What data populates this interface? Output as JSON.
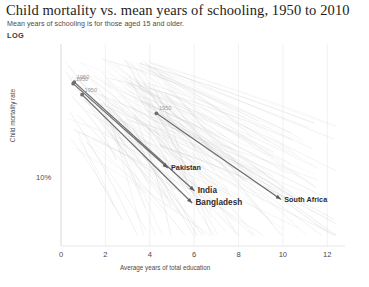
{
  "header": {
    "title": "Child mortality vs. mean years of schooling, 1950 to 2010",
    "subtitle": "Mean years of schooling is for those aged 15 and older.",
    "scale_badge": "LOG"
  },
  "chart_data": {
    "type": "line",
    "title": "Child mortality vs. mean years of schooling, 1950 to 2010",
    "subtitle": "Mean years of schooling is for those aged 15 and older.",
    "xlabel": "Average years of total education",
    "ylabel": "Child mortality rate",
    "yscale": "log",
    "xlim": [
      0,
      12.8
    ],
    "xticks": [
      0,
      2,
      4,
      6,
      8,
      10,
      12
    ],
    "xtick_labels": [
      "0",
      "2",
      "4",
      "6",
      "8",
      "10",
      "12"
    ],
    "yticks": [
      10
    ],
    "ytick_labels": [
      "10%"
    ],
    "grid": "vertical-faint",
    "legend": "none",
    "annotation_year_start": "1950",
    "series": [
      {
        "name": "Bangladesh",
        "highlight": true,
        "start_year": "1950",
        "end_year": "2010",
        "start": {
          "x": 0.95,
          "y": 30.5
        },
        "end": {
          "x": 5.9,
          "y": 4.6
        },
        "label_position": "right"
      },
      {
        "name": "India",
        "highlight": true,
        "start_year": "1950",
        "end_year": "2010",
        "start": {
          "x": 0.6,
          "y": 38.0
        },
        "end": {
          "x": 6.0,
          "y": 5.7
        },
        "label_position": "right"
      },
      {
        "name": "Pakistan",
        "highlight": true,
        "start_year": "1950",
        "end_year": "2010",
        "start": {
          "x": 0.55,
          "y": 37.0
        },
        "end": {
          "x": 4.8,
          "y": 8.5
        },
        "label_position": "right"
      },
      {
        "name": "South Africa",
        "highlight": true,
        "start_year": "1950",
        "end_year": "2010",
        "start": {
          "x": 4.3,
          "y": 22.0
        },
        "end": {
          "x": 9.9,
          "y": 4.9
        },
        "label_position": "right"
      }
    ],
    "background_series_note": "Many faint grey country trajectories fan downward from upper-left to lower-right"
  }
}
